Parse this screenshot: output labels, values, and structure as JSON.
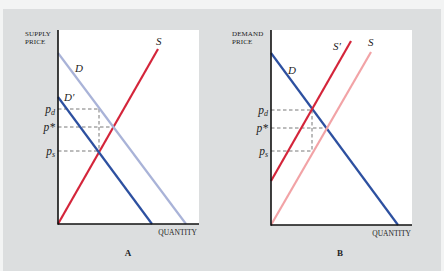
{
  "figure": {
    "background": "#f3f4f4",
    "panel_background": "#dcdedf",
    "plot_background": "#ffffff",
    "colors": {
      "red": "#d4253a",
      "pink": "#f2a3a6",
      "blue": "#2d50a0",
      "light_blue": "#a9b3d8",
      "axis": "#111111",
      "dash": "#555555"
    }
  },
  "panels": [
    {
      "id": "A",
      "letter": "A",
      "y_axis_title": [
        "SUPPLY",
        "PRICE"
      ],
      "x_axis_title": "QUANTITY",
      "plot": {
        "x0": 58,
        "x1": 199,
        "y0": 30,
        "y1": 224
      },
      "curves": [
        {
          "name": "supply-curve-s",
          "label": "S",
          "color": "red",
          "from": [
            58,
            224
          ],
          "to": [
            158,
            49
          ],
          "label_pos": [
            156,
            45
          ]
        },
        {
          "name": "demand-curve-d",
          "label": "D",
          "color": "light_blue",
          "from": [
            58,
            53
          ],
          "to": [
            186,
            224
          ],
          "label_pos": [
            75,
            72
          ]
        },
        {
          "name": "demand-curve-d-prime",
          "label": "D′",
          "color": "blue",
          "from": [
            58,
            97
          ],
          "to": [
            152,
            224
          ],
          "label_pos": [
            64,
            101
          ]
        }
      ],
      "prices": [
        {
          "name": "price-pd",
          "main": "p",
          "sub": "d",
          "y": 109,
          "x_end": 99
        },
        {
          "name": "price-p-star",
          "main": "p*",
          "sub": "",
          "y": 127,
          "x_end": 112
        },
        {
          "name": "price-ps",
          "main": "p",
          "sub": "s",
          "y": 151,
          "x_end": 99
        }
      ],
      "vertical_dash": {
        "x": 99,
        "y_top": 109,
        "y_bottom": 151
      },
      "y_title_pos": [
        25,
        36
      ],
      "x_title_pos": [
        197,
        235
      ],
      "letter_pos": [
        128,
        256
      ]
    },
    {
      "id": "B",
      "letter": "B",
      "y_axis_title": [
        "DEMAND",
        "PRICE"
      ],
      "x_axis_title": "QUANTITY",
      "plot": {
        "x0": 271,
        "x1": 412,
        "y0": 30,
        "y1": 225
      },
      "curves": [
        {
          "name": "demand-curve-d",
          "label": "D",
          "color": "blue",
          "from": [
            271,
            53
          ],
          "to": [
            398,
            225
          ],
          "label_pos": [
            288,
            74
          ]
        },
        {
          "name": "supply-curve-s-prime",
          "label": "S′",
          "color": "red",
          "from": [
            271,
            181
          ],
          "to": [
            351,
            41
          ],
          "label_pos": [
            333,
            50
          ]
        },
        {
          "name": "supply-curve-s",
          "label": "S",
          "color": "pink",
          "from": [
            271,
            225
          ],
          "to": [
            371,
            52
          ],
          "label_pos": [
            368,
            46
          ]
        }
      ],
      "prices": [
        {
          "name": "price-pd",
          "main": "p",
          "sub": "d",
          "y": 110,
          "x_end": 312
        },
        {
          "name": "price-p-star",
          "main": "p*",
          "sub": "",
          "y": 128,
          "x_end": 325
        },
        {
          "name": "price-ps",
          "main": "p",
          "sub": "s",
          "y": 151,
          "x_end": 312
        }
      ],
      "vertical_dash": {
        "x": 312,
        "y_top": 110,
        "y_bottom": 151
      },
      "y_title_pos": [
        232,
        36
      ],
      "x_title_pos": [
        411,
        236
      ],
      "letter_pos": [
        340,
        256
      ]
    }
  ]
}
